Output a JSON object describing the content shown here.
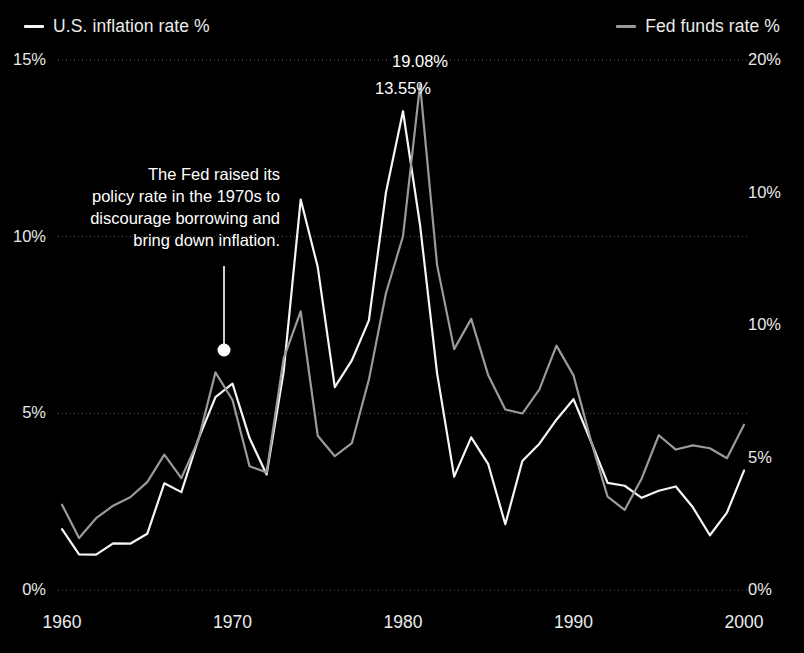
{
  "legend": {
    "left": {
      "label": "U.S. inflation rate %",
      "color": "#f5f5f5",
      "icon": "line-swatch-icon"
    },
    "right": {
      "label": "Fed funds rate %",
      "color": "#9a9a9a",
      "icon": "line-swatch-icon"
    }
  },
  "annotation": {
    "lines": [
      "The Fed raised its",
      "policy rate in the 1970s to",
      "discourage borrowing and",
      "bring down inflation."
    ],
    "marker": "annotation-dot"
  },
  "peaks": [
    {
      "label": "13.55%",
      "series": "U.S. inflation rate %",
      "year": 1980,
      "value": 13.55
    },
    {
      "label": "19.08%",
      "series": "Fed funds rate %",
      "year": 1981,
      "value": 19.08
    }
  ],
  "chart_data": {
    "type": "line",
    "title": "",
    "xlabel": "",
    "ylabel": "",
    "grid": true,
    "legend_position": "top",
    "x": [
      1960,
      1961,
      1962,
      1963,
      1964,
      1965,
      1966,
      1967,
      1968,
      1969,
      1970,
      1971,
      1972,
      1973,
      1974,
      1975,
      1976,
      1977,
      1978,
      1979,
      1980,
      1981,
      1982,
      1983,
      1984,
      1985,
      1986,
      1987,
      1988,
      1989,
      1990,
      1991,
      1992,
      1993,
      1994,
      1995,
      1996,
      1997,
      1998,
      1999,
      2000
    ],
    "xticks": [
      1960,
      1970,
      1980,
      1990,
      2000
    ],
    "xtick_labels": [
      "1960",
      "1970",
      "1980",
      "1990",
      "2000"
    ],
    "xlim": [
      1960,
      2000
    ],
    "left_axis": {
      "name": "U.S. inflation rate %",
      "ylim": [
        0,
        15
      ],
      "yticks": [
        0,
        5,
        10,
        15
      ],
      "ytick_labels": [
        "0%",
        "5%",
        "10%",
        "15%"
      ]
    },
    "right_axis": {
      "name": "Fed funds rate %",
      "ylim": [
        0,
        20
      ],
      "yticks": [
        0,
        5,
        10,
        15,
        20
      ],
      "ytick_labels": [
        "0%",
        "5%",
        "10%",
        "10%",
        "20%"
      ]
    },
    "series": [
      {
        "name": "U.S. inflation rate %",
        "axis": "left",
        "color": "#f5f5f5",
        "values": [
          1.72,
          1.01,
          1.0,
          1.32,
          1.31,
          1.59,
          3.02,
          2.77,
          4.27,
          5.46,
          5.84,
          4.3,
          3.27,
          6.18,
          11.05,
          9.14,
          5.74,
          6.5,
          7.63,
          11.25,
          13.55,
          10.33,
          6.13,
          3.21,
          4.32,
          3.56,
          1.86,
          3.65,
          4.14,
          4.82,
          5.4,
          4.23,
          3.03,
          2.95,
          2.61,
          2.81,
          2.93,
          2.34,
          1.55,
          2.19,
          3.38
        ]
      },
      {
        "name": "Fed funds rate %",
        "axis": "right",
        "color": "#9a9a9a",
        "values": [
          3.22,
          1.96,
          2.71,
          3.18,
          3.5,
          4.07,
          5.11,
          4.22,
          5.66,
          8.21,
          7.17,
          4.67,
          4.44,
          8.74,
          10.51,
          5.82,
          5.05,
          5.54,
          7.94,
          11.2,
          13.35,
          19.08,
          12.26,
          9.09,
          10.23,
          8.1,
          6.81,
          6.66,
          7.57,
          9.22,
          8.1,
          5.69,
          3.52,
          3.02,
          4.21,
          5.84,
          5.3,
          5.46,
          5.35,
          4.97,
          6.24
        ]
      }
    ]
  }
}
